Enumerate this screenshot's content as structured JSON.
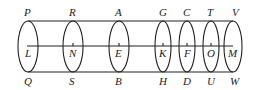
{
  "diagram": {
    "top_labels": [
      "P",
      "R",
      "A",
      "G",
      "C",
      "T",
      "V"
    ],
    "center_labels": [
      "L",
      "N",
      "E",
      "K",
      "F",
      "O",
      "M"
    ],
    "bottom_labels": [
      "Q",
      "S",
      "B",
      "H",
      "D",
      "U",
      "W"
    ],
    "sections": [
      {
        "top": "P",
        "center": "L",
        "bottom": "Q"
      },
      {
        "top": "R",
        "center": "N",
        "bottom": "S"
      },
      {
        "top": "A",
        "center": "E",
        "bottom": "B"
      },
      {
        "top": "G",
        "center": "K",
        "bottom": "H"
      },
      {
        "top": "C",
        "center": "F",
        "bottom": "D"
      },
      {
        "top": "T",
        "center": "O",
        "bottom": "U"
      },
      {
        "top": "V",
        "center": "M",
        "bottom": "W"
      }
    ],
    "colors": {
      "line": "#222222",
      "background": "#ffffff"
    }
  }
}
